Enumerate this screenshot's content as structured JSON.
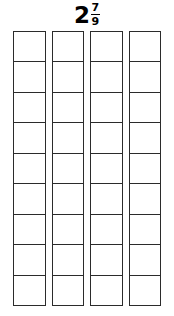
{
  "title": {
    "whole_number": "2",
    "numerator": "7",
    "denominator": "9",
    "full_text": "2 7/9"
  },
  "model": {
    "bar_count": 4,
    "cells_per_bar": 9,
    "shaded_cells_total": 0,
    "all_cells_empty": true
  },
  "colors": {
    "background": "#ffffff",
    "stroke": "#2b2b2b",
    "text": "#000000",
    "cell_fill": "#ffffff"
  }
}
